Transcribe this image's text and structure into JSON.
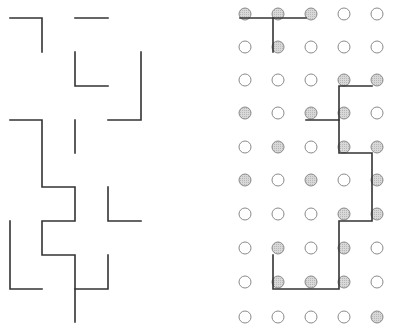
{
  "diagram": {
    "title": "",
    "left_panel": {
      "description": "maze-like line segments",
      "stroke_color": "#333333",
      "polylines": [
        [
          [
            10,
            18
          ],
          [
            42,
            18
          ],
          [
            42,
            52
          ]
        ],
        [
          [
            75,
            18
          ],
          [
            108,
            18
          ]
        ],
        [
          [
            75,
            52
          ],
          [
            75,
            86
          ],
          [
            108,
            86
          ]
        ],
        [
          [
            141,
            52
          ],
          [
            141,
            120
          ],
          [
            108,
            120
          ]
        ],
        [
          [
            10,
            120
          ],
          [
            42,
            120
          ],
          [
            42,
            187
          ],
          [
            75,
            187
          ],
          [
            75,
            221
          ],
          [
            42,
            221
          ],
          [
            42,
            255
          ],
          [
            75,
            255
          ],
          [
            75,
            322
          ]
        ],
        [
          [
            75,
            120
          ],
          [
            75,
            153
          ]
        ],
        [
          [
            108,
            187
          ],
          [
            108,
            221
          ],
          [
            141,
            221
          ]
        ],
        [
          [
            10,
            221
          ],
          [
            10,
            289
          ],
          [
            42,
            289
          ]
        ],
        [
          [
            75,
            289
          ],
          [
            108,
            289
          ],
          [
            108,
            255
          ]
        ]
      ]
    },
    "right_panel": {
      "description": "5x10 grid of circles, some shaded, with connecting path segments",
      "columns_x": [
        245,
        278,
        311,
        344,
        377
      ],
      "rows_y": [
        14,
        47,
        80,
        113,
        147,
        180,
        214,
        248,
        282,
        317
      ],
      "radius": 6,
      "open_color": "#ffffff",
      "shaded_color": "#cfcfcf",
      "outline_color": "#8a8a8a",
      "shaded": [
        [
          0,
          1,
          2
        ],
        [
          1
        ],
        [
          3,
          4
        ],
        [
          0,
          2,
          3
        ],
        [
          1,
          3,
          4
        ],
        [
          0,
          2,
          4
        ],
        [
          3,
          4
        ],
        [
          1,
          3
        ],
        [
          1,
          2,
          3
        ],
        [
          4
        ]
      ],
      "stroke_color": "#333333",
      "polylines": [
        [
          [
            240,
            18
          ],
          [
            306,
            18
          ]
        ],
        [
          [
            273,
            18
          ],
          [
            273,
            52
          ]
        ],
        [
          [
            372,
            86
          ],
          [
            339,
            86
          ],
          [
            339,
            153
          ],
          [
            372,
            153
          ],
          [
            372,
            221
          ],
          [
            339,
            221
          ],
          [
            339,
            289
          ],
          [
            273,
            289
          ],
          [
            273,
            255
          ]
        ],
        [
          [
            306,
            120
          ],
          [
            339,
            120
          ]
        ]
      ]
    }
  }
}
